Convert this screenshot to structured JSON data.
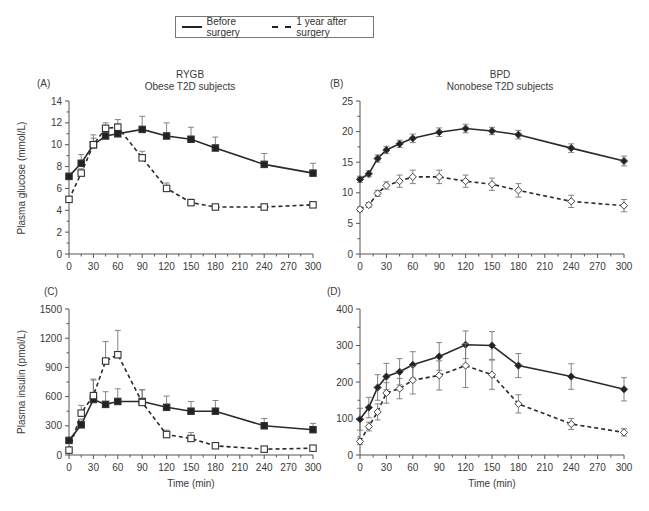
{
  "legend": {
    "before_label": "Before surgery",
    "after_label": "1 year after surgery"
  },
  "panels": {
    "A": {
      "letter": "(A)",
      "title_line1": "RYGB",
      "title_line2": "Obese T2D subjects"
    },
    "B": {
      "letter": "(B)",
      "title_line1": "BPD",
      "title_line2": "Nonobese T2D subjects"
    },
    "C": {
      "letter": "(C)"
    },
    "D": {
      "letter": "(D)"
    }
  },
  "axes": {
    "ylabel_glucose": "Plasma glucose (mmol/L)",
    "ylabel_insulin": "Plasma insulin (pmol/L)",
    "xlabel": "Time (min)"
  },
  "chart_data": [
    {
      "panel": "A",
      "type": "line",
      "title": "RYGB — Obese T2D subjects",
      "xlabel": "",
      "ylabel": "Plasma glucose (mmol/L)",
      "xlim": [
        0,
        300
      ],
      "ylim": [
        0,
        14
      ],
      "xticks": [
        0,
        30,
        60,
        90,
        120,
        150,
        180,
        210,
        240,
        270,
        300
      ],
      "yticks": [
        0,
        2,
        4,
        6,
        8,
        10,
        12,
        14
      ],
      "marker": "square",
      "series": [
        {
          "name": "Before surgery",
          "style": "solid",
          "x": [
            0,
            15,
            30,
            45,
            60,
            90,
            120,
            150,
            180,
            240,
            300
          ],
          "values": [
            7.1,
            8.3,
            10.0,
            10.8,
            11.0,
            11.4,
            10.8,
            10.5,
            9.7,
            8.2,
            7.4
          ],
          "error": [
            0.3,
            0.8,
            0.9,
            0.9,
            0.9,
            1.2,
            1.2,
            1.1,
            1.0,
            1.0,
            0.9
          ]
        },
        {
          "name": "1 year after surgery",
          "style": "dashed",
          "x": [
            0,
            15,
            30,
            45,
            60,
            90,
            120,
            150,
            180,
            240,
            300
          ],
          "values": [
            5.0,
            7.4,
            10.0,
            11.5,
            11.6,
            8.8,
            6.0,
            4.7,
            4.3,
            4.3,
            4.5
          ],
          "error": [
            0.2,
            0.4,
            0.6,
            0.5,
            0.7,
            0.6,
            0.5,
            0.3,
            0.2,
            0.2,
            0.2
          ]
        }
      ]
    },
    {
      "panel": "B",
      "type": "line",
      "title": "BPD — Nonobese T2D subjects",
      "xlabel": "",
      "ylabel": "",
      "xlim": [
        0,
        300
      ],
      "ylim": [
        0,
        25
      ],
      "xticks": [
        0,
        30,
        60,
        90,
        120,
        150,
        180,
        210,
        240,
        270,
        300
      ],
      "yticks": [
        0,
        5,
        10,
        15,
        20,
        25
      ],
      "marker": "diamond",
      "series": [
        {
          "name": "Before surgery",
          "style": "solid",
          "x": [
            0,
            10,
            20,
            30,
            45,
            60,
            90,
            120,
            150,
            180,
            240,
            300
          ],
          "values": [
            12.2,
            13.1,
            15.6,
            17.0,
            18.0,
            18.9,
            19.9,
            20.5,
            20.1,
            19.5,
            17.3,
            15.2
          ],
          "error": [
            0.5,
            0.5,
            0.6,
            0.6,
            0.6,
            0.7,
            0.7,
            0.7,
            0.6,
            0.7,
            0.7,
            0.8
          ]
        },
        {
          "name": "1 year after surgery",
          "style": "dashed",
          "x": [
            0,
            10,
            20,
            30,
            45,
            60,
            90,
            120,
            150,
            180,
            240,
            300
          ],
          "values": [
            7.3,
            8.0,
            9.9,
            11.2,
            11.9,
            12.6,
            12.6,
            11.9,
            11.4,
            10.4,
            8.6,
            7.9
          ],
          "error": [
            0.4,
            0.4,
            0.5,
            0.6,
            1.0,
            1.1,
            1.1,
            1.0,
            1.0,
            1.1,
            1.0,
            1.0
          ]
        }
      ]
    },
    {
      "panel": "C",
      "type": "line",
      "title": "",
      "xlabel": "Time (min)",
      "ylabel": "Plasma insulin (pmol/L)",
      "xlim": [
        0,
        300
      ],
      "ylim": [
        0,
        1500
      ],
      "xticks": [
        0,
        30,
        60,
        90,
        120,
        150,
        180,
        210,
        240,
        270,
        300
      ],
      "yticks": [
        0,
        300,
        600,
        900,
        1200,
        1500
      ],
      "marker": "square",
      "series": [
        {
          "name": "Before surgery",
          "style": "solid",
          "x": [
            0,
            15,
            30,
            45,
            60,
            90,
            120,
            150,
            180,
            240,
            300
          ],
          "values": [
            150,
            310,
            570,
            520,
            550,
            550,
            490,
            450,
            450,
            300,
            260
          ],
          "error": [
            20,
            60,
            200,
            130,
            130,
            120,
            115,
            100,
            110,
            75,
            65
          ]
        },
        {
          "name": "1 year after surgery",
          "style": "dashed",
          "x": [
            0,
            15,
            30,
            45,
            60,
            90,
            120,
            150,
            180,
            240,
            300
          ],
          "values": [
            50,
            430,
            610,
            965,
            1030,
            540,
            210,
            170,
            95,
            60,
            70
          ],
          "error": [
            15,
            80,
            170,
            200,
            250,
            130,
            45,
            60,
            25,
            15,
            15
          ]
        }
      ]
    },
    {
      "panel": "D",
      "type": "line",
      "title": "",
      "xlabel": "Time (min)",
      "ylabel": "",
      "xlim": [
        0,
        300
      ],
      "ylim": [
        0,
        400
      ],
      "xticks": [
        0,
        30,
        60,
        90,
        120,
        150,
        180,
        210,
        240,
        270,
        300
      ],
      "yticks": [
        0,
        100,
        200,
        300,
        400
      ],
      "marker": "diamond",
      "series": [
        {
          "name": "Before surgery",
          "style": "solid",
          "x": [
            0,
            10,
            20,
            30,
            45,
            60,
            90,
            120,
            150,
            180,
            240,
            300
          ],
          "values": [
            98,
            130,
            185,
            215,
            228,
            247,
            270,
            302,
            300,
            245,
            215,
            180
          ],
          "error": [
            30,
            28,
            35,
            36,
            36,
            36,
            38,
            38,
            38,
            33,
            35,
            32
          ]
        },
        {
          "name": "1 year after surgery",
          "style": "dashed",
          "x": [
            0,
            10,
            20,
            30,
            45,
            60,
            90,
            120,
            150,
            180,
            240,
            300
          ],
          "values": [
            37,
            78,
            118,
            170,
            182,
            205,
            218,
            245,
            220,
            140,
            85,
            62
          ],
          "error": [
            8,
            12,
            22,
            28,
            28,
            38,
            40,
            60,
            40,
            25,
            15,
            10
          ]
        }
      ]
    }
  ]
}
